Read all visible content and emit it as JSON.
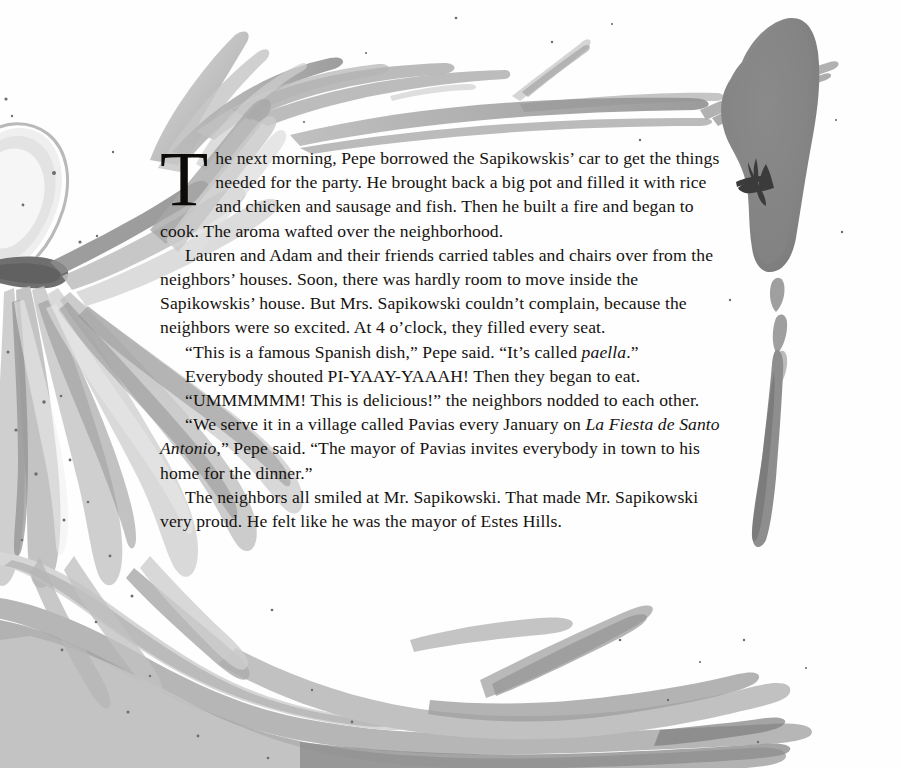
{
  "page": {
    "type": "storybook-page",
    "background_color": "#ffffff",
    "text_color": "#15120f",
    "illustration": {
      "style": "watercolor-brush-strokes",
      "palette": [
        "#c9c9c9",
        "#b3b3b3",
        "#9d9d9d",
        "#8a8a8a",
        "#777777",
        "#5e5e5e",
        "#e2e2e2",
        "#f0f0f0"
      ],
      "elements": [
        "top-left-branch-strokes",
        "top-right-long-stroke",
        "left-flower-petal-cluster",
        "right-dark-blob-with-star",
        "right-margin-small-strokes",
        "bottom-sweeping-strokes",
        "ink-speckles"
      ]
    }
  },
  "story": {
    "dropcap": "T",
    "paragraphs": [
      {
        "id": "p1",
        "has_dropcap": true,
        "text": "he next morning, Pepe borrowed the Sapikowskis’ car to get the things needed for the party. He brought back a big pot and filled it with rice and chicken and sausage and fish. Then he built a fire and began to cook. The aroma wafted over the neighborhood."
      },
      {
        "id": "p2",
        "has_dropcap": false,
        "indent": true,
        "text": "Lauren and Adam and their friends carried tables and chairs over from the neighbors’ houses. Soon, there was hardly room to move inside the Sapikowskis’ house. But Mrs. Sapikowski couldn’t complain, because the neighbors were so excited. At 4 o’clock, they filled every seat."
      },
      {
        "id": "p3",
        "has_dropcap": false,
        "indent": true,
        "segments": [
          {
            "text": "“This is a famous Spanish dish,” Pepe said. “It’s called ",
            "italic": false
          },
          {
            "text": "paella",
            "italic": true
          },
          {
            "text": ".”",
            "italic": false
          }
        ]
      },
      {
        "id": "p4",
        "has_dropcap": false,
        "indent": true,
        "text": "Everybody shouted PI-YAAY-YAAAH! Then they began to eat."
      },
      {
        "id": "p5",
        "has_dropcap": false,
        "indent": true,
        "text": "“UMMMMMM! This is delicious!” the neighbors nodded to each other."
      },
      {
        "id": "p6",
        "has_dropcap": false,
        "indent": true,
        "segments": [
          {
            "text": "“We serve it in a village called Pavias every January on ",
            "italic": false
          },
          {
            "text": "La Fiesta de Santo Antonio",
            "italic": true
          },
          {
            "text": ",” Pepe said. “The mayor of Pavias invites everybody in town to his home for the dinner.”",
            "italic": false
          }
        ]
      },
      {
        "id": "p7",
        "has_dropcap": false,
        "indent": true,
        "text": "The neighbors all smiled at Mr. Sapikowski. That made Mr. Sapikowski very proud. He felt like he was the mayor of Estes Hills."
      }
    ]
  }
}
